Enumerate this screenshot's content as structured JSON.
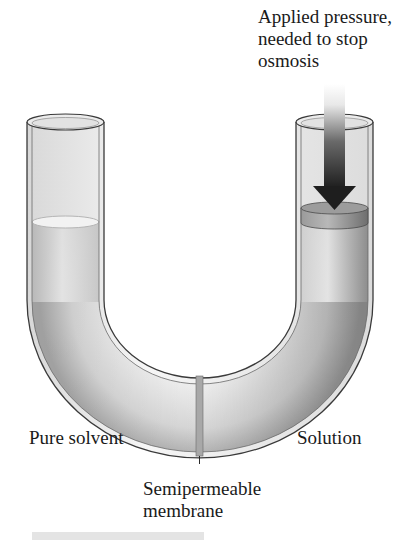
{
  "figure": {
    "labels": {
      "applied_pressure": [
        "Applied pressure,",
        "needed to stop",
        "osmosis"
      ],
      "pure_solvent": "Pure solvent",
      "solution": "Solution",
      "membrane": [
        "Semipermeable",
        "membrane"
      ]
    },
    "components": {
      "left_arm": "pure-solvent column",
      "right_arm": "solution column with piston",
      "piston": "disc applying pressure",
      "arrow": "downward pressure arrow",
      "membrane": "vertical barrier at bottom of U-bend"
    },
    "colors": {
      "tube_outline": "#3a3a3a",
      "liquid_light": "#e6e6e6",
      "liquid_dark": "#9a9a9a",
      "arrow_dark": "#2a2a2a",
      "piston": "#8a8a8a",
      "membrane": "#a8a8a8"
    }
  }
}
